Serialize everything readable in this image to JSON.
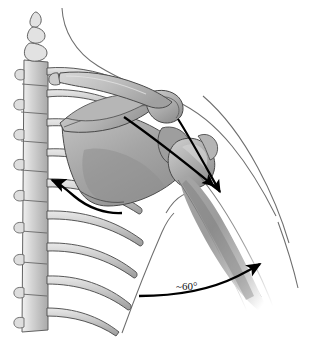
{
  "figure": {
    "name": "shoulder-girdle-posterior-illustration",
    "background_color": "#ffffff",
    "annotations": {
      "angle_label": "~60°",
      "angle_value": 60,
      "angle_prefix": "~",
      "angle_unit": "°"
    },
    "arrows": {
      "medial_curved_arrow": {
        "name": "scapular-retraction-arrow",
        "direction": "up-left toward vertebral column",
        "color": "#000000"
      },
      "humerus_arrow_upper": {
        "name": "humerus-force-arrow-upper",
        "direction": "down-right along humerus",
        "color": "#000000"
      },
      "humerus_arrow_lower": {
        "name": "humerus-force-arrow-lower",
        "direction": "down-right along humerus",
        "color": "#000000"
      },
      "angle_arc_arrow": {
        "name": "scapular-plane-angle-arrow",
        "direction": "curving up-right",
        "color": "#000000"
      }
    },
    "structures": [
      {
        "name": "vertebral-column",
        "label": "Vertebral column with spinous processes",
        "fill": "#c9c9c9",
        "stroke": "#555555"
      },
      {
        "name": "ribs",
        "label": "Ribs",
        "fill": "#c4c4c4",
        "stroke": "#4d4d4d"
      },
      {
        "name": "scapula-body",
        "label": "Scapula body",
        "fill": "#a8a8a8",
        "stroke": "#4a4a4a"
      },
      {
        "name": "scapular-spine",
        "label": "Spine of scapula",
        "fill": "#b4b4b4",
        "stroke": "#4a4a4a"
      },
      {
        "name": "acromion",
        "label": "Acromion",
        "fill": "#b8b8b8",
        "stroke": "#474747"
      },
      {
        "name": "clavicle",
        "label": "Clavicle",
        "fill": "#bdbdbd",
        "stroke": "#4a4a4a"
      },
      {
        "name": "humeral-head",
        "label": "Humeral head",
        "fill": "#b0b0b0",
        "stroke": "#474747"
      },
      {
        "name": "humerus-shaft",
        "label": "Humerus shaft",
        "fill": "#9e9e9e",
        "stroke": "#5a5a5a"
      },
      {
        "name": "neck-contour",
        "label": "Neck skin contour",
        "fill": "none",
        "stroke": "#6a6a6a"
      },
      {
        "name": "torso-contour",
        "label": "Torso skin contour",
        "fill": "none",
        "stroke": "#6a6a6a"
      },
      {
        "name": "arm-contour",
        "label": "Arm skin contour",
        "fill": "none",
        "stroke": "#6a6a6a"
      }
    ],
    "colors": {
      "bone_light": "#c9c9c9",
      "bone_mid": "#aeaeae",
      "bone_dark": "#8e8e8e",
      "outline": "#4a4a4a",
      "contour": "#6a6a6a",
      "arrow": "#000000",
      "text": "#111111"
    }
  }
}
